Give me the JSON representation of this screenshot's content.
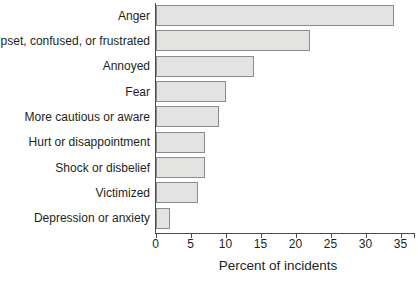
{
  "chart_data": {
    "type": "bar",
    "orientation": "horizontal",
    "categories": [
      "Anger",
      "Upset, confused, or frustrated",
      "Annoyed",
      "Fear",
      "More cautious or aware",
      "Hurt or disappointment",
      "Shock or disbelief",
      "Victimized",
      "Depression or anxiety"
    ],
    "values": [
      34,
      22,
      14,
      10,
      9,
      7,
      7,
      6,
      2
    ],
    "title": "",
    "xlabel": "Percent of incidents",
    "ylabel": "",
    "xlim": [
      0,
      35
    ],
    "xticks": [
      0,
      5,
      10,
      15,
      20,
      25,
      30,
      35
    ],
    "grid": false,
    "legend": "none",
    "bar_fill": "#e3e3e2",
    "bar_border": "#8c8c8c",
    "axis_color": "#4a4a4a",
    "text_color": "#231f20"
  }
}
